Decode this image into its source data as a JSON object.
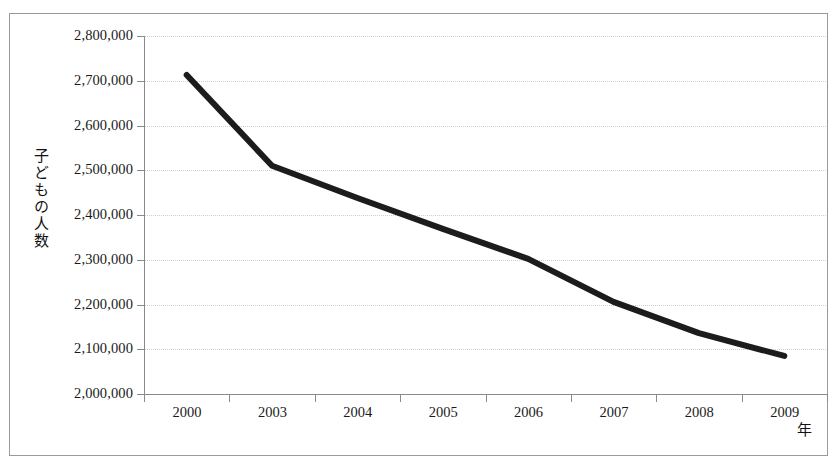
{
  "chart_data": {
    "type": "line",
    "title": "",
    "xlabel": "年",
    "ylabel": "子どもの人数",
    "categories": [
      "2000",
      "2003",
      "2004",
      "2005",
      "2006",
      "2007",
      "2008",
      "2009"
    ],
    "series": [
      {
        "name": "子どもの人数",
        "values": [
          2713000,
          2510000,
          2438000,
          2369000,
          2302000,
          2206000,
          2136000,
          2085000
        ],
        "color": "#1c1c1c",
        "line_width": 6,
        "markers": false
      }
    ],
    "ylim": [
      2000000,
      2800000
    ],
    "ytick_step": 100000,
    "ytick_labels": [
      "2,800,000",
      "2,700,000",
      "2,600,000",
      "2,500,000",
      "2,400,000",
      "2,300,000",
      "2,200,000",
      "2,100,000",
      "2,000,000"
    ],
    "ytick_values": [
      2800000,
      2700000,
      2600000,
      2500000,
      2400000,
      2300000,
      2200000,
      2100000,
      2000000
    ],
    "grid": {
      "horizontal": true,
      "vertical": false,
      "style": "dotted",
      "color": "#cfcfcf"
    },
    "legend": {
      "visible": false,
      "position": "none"
    },
    "axis_color": "#8a8a8a",
    "background": "#ffffff",
    "border_color": "#9a9a9a"
  }
}
